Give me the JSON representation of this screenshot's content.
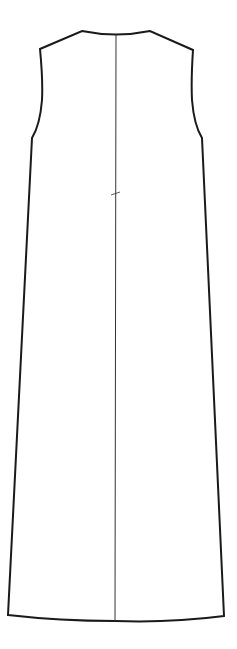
{
  "diagram": {
    "type": "technical-flat-sketch",
    "colors": {
      "background": "#ffffff",
      "outline": "#1a1a1a",
      "seam": "#333333"
    },
    "features": [
      "rounded neckline",
      "sleeveless armholes",
      "center front seam",
      "waist notch mark",
      "curved hem"
    ]
  }
}
